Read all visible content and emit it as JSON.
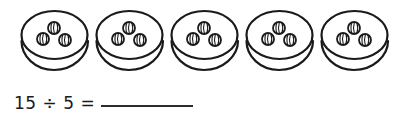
{
  "worksheet": {
    "title": "division-grouping-worksheet",
    "background_color": "#ffffff",
    "ink_color": "#1a1a1a"
  },
  "illustration": {
    "name": "five-plates-with-three-marbles-each",
    "item_icon": "striped-marble-icon",
    "container_icon": "oval-plate-icon",
    "group_count": 5,
    "items_per_group": 3,
    "total_items": 15,
    "groups": [
      {
        "label": "plate-1",
        "x": 18,
        "items": 3
      },
      {
        "label": "plate-2",
        "x": 93,
        "items": 3
      },
      {
        "label": "plate-3",
        "x": 168,
        "items": 3
      },
      {
        "label": "plate-4",
        "x": 243,
        "items": 3
      },
      {
        "label": "plate-5",
        "x": 318,
        "items": 3
      }
    ]
  },
  "equation": {
    "dividend": "15",
    "divisor": "5",
    "division_sign": "÷",
    "equals_sign": "=",
    "expression": "15 ÷ 5 =",
    "answer_value": "",
    "answer_placeholder": ""
  }
}
